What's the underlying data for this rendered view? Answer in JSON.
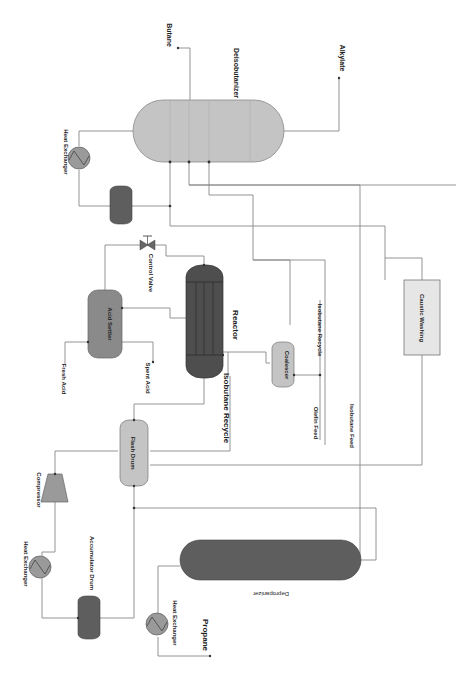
{
  "diagram": {
    "orientation": "rotated 90 degrees clockwise",
    "colors": {
      "light_vessel": "#c4c4c4",
      "dark_vessel": "#5e5e5e",
      "medium_vessel": "#8a8a8a",
      "reactor": "#4e4e4e",
      "line": "#888888",
      "box_fill": "#e6e6e6"
    },
    "equipment": {
      "deisobutanizer": "Deisobutanizer",
      "heat_exchanger_top": "Heat Exchanger",
      "acid_settler": "Acid Settler",
      "control_valve": "Control Valve",
      "reactor": "Reactor",
      "coalescer": "Coalescer",
      "caustic_washing": "Caustic Washing",
      "flash_drum": "Flash Drum",
      "compressor": "Compressor",
      "heat_exchanger_mid": "Heat Exchanger",
      "accumulator_drum": "Accumulator Drum",
      "heat_exchanger_bottom": "Heat Exchanger",
      "depropanizer": "Depropanizer"
    },
    "streams": {
      "butane": "Butane",
      "alkylate": "Alkylate",
      "fresh_acid": "Fresh Acid",
      "spent_acid": "Spent Acid",
      "isobutane_recycle_main": "Isobutane Recycle",
      "isobutane_recycle_small": "Isobutane Recycle",
      "olefin_feed": "Olefin Feed",
      "isobutane_feed": "Isobutane Feed",
      "propane": "Propane"
    }
  }
}
